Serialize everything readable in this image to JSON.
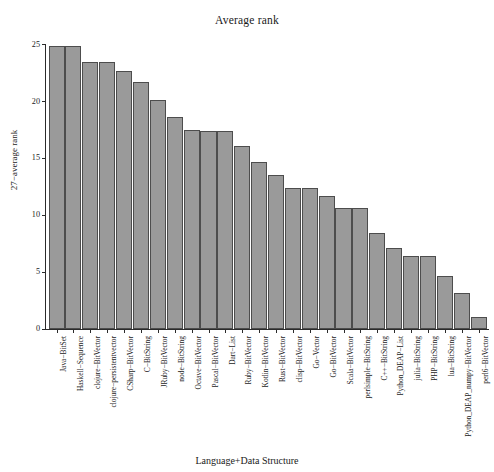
{
  "chart_data": {
    "type": "bar",
    "title": "Average rank",
    "xlabel": "Language+Data Structure",
    "ylabel": "27−average rank",
    "ylim": [
      0,
      26
    ],
    "yticks": [
      0,
      5,
      10,
      15,
      20,
      25
    ],
    "grid": false,
    "legend": null,
    "bar_color": "#9a9a9a",
    "bar_edge_color": "#4d4d4d",
    "categories": [
      "Java−BitSet",
      "Haskell−Sequence",
      "clojure−BitVector",
      "clojure−persistentvector",
      "CSharp−BitVector",
      "C−BitString",
      "JRuby−BitVector",
      "node−BitString",
      "Octave−BitVector",
      "Pascal−BitVector",
      "Dart−List",
      "Ruby−BitVector",
      "Kotlin−BitVector",
      "Rust−BitVector",
      "clisp−BitVector",
      "Go−Vector",
      "Go−BitVector",
      "Scala−BitVector",
      "perlsimple−BitString",
      "C++−BitString",
      "Python_DEAP−List",
      "julia−BitString",
      "PHP−BitString",
      "lua−BitString",
      "Python_DEAP_numpy−BitVector",
      "perl6−BitVector"
    ],
    "values": [
      24.9,
      24.9,
      23.5,
      23.5,
      22.7,
      21.7,
      20.1,
      18.6,
      17.5,
      17.4,
      17.4,
      16.1,
      14.7,
      13.5,
      12.4,
      12.4,
      11.7,
      10.6,
      10.6,
      8.4,
      7.1,
      6.4,
      6.4,
      4.7,
      3.2,
      1.1
    ]
  }
}
